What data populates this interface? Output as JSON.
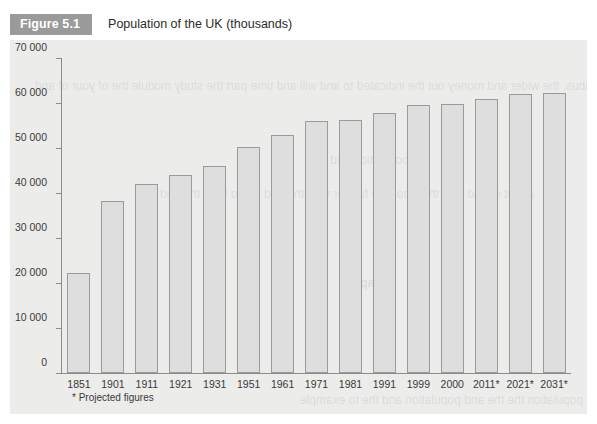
{
  "figure": {
    "tag": "Figure 5.1",
    "title": "Population of the UK (thousands)",
    "footnote": "* Projected figures"
  },
  "colors": {
    "tag_background": "#9a9a9a",
    "tag_text": "#ffffff",
    "panel_background": "#ececeb",
    "bar_fill": "#dedede",
    "bar_border": "#9a9a9a",
    "axis": "#8c8c8c",
    "text": "#3a3a3a"
  },
  "ghost_text": {
    "heading": "Population",
    "block_1": "the main the the to welcome is the position best of the very you thank\nwelcome further very those together these syllabus, the\nwider and money out the indicated to\nand will and time part the study module the of\nyour of and",
    "block_2": "about of\nand else the who\nnow further very the and the to from the and",
    "block_3": "Chapter",
    "block_4": "the and the and population the\nthe and population and the to example",
    "block_5": "the population and the"
  },
  "chart_data": {
    "type": "bar",
    "title": "Population of the UK (thousands)",
    "xlabel": "",
    "ylabel": "",
    "ylim": [
      0,
      70000
    ],
    "ytick_values": [
      0,
      10000,
      20000,
      30000,
      40000,
      50000,
      60000,
      70000
    ],
    "ytick_labels": [
      "0",
      "10 000",
      "20 000",
      "30 000",
      "40 000",
      "50 000",
      "60 000",
      "70 000"
    ],
    "grid": false,
    "legend": null,
    "categories": [
      "1851",
      "1901",
      "1911",
      "1921",
      "1931",
      "1951",
      "1961",
      "1971",
      "1981",
      "1991",
      "1999",
      "2000",
      "2011*",
      "2021*",
      "2031*"
    ],
    "values": [
      22300,
      38200,
      42100,
      44000,
      46000,
      50200,
      52800,
      55900,
      56300,
      57800,
      59500,
      59800,
      61000,
      62000,
      62200
    ],
    "annotations": [
      "* Projected figures"
    ]
  }
}
